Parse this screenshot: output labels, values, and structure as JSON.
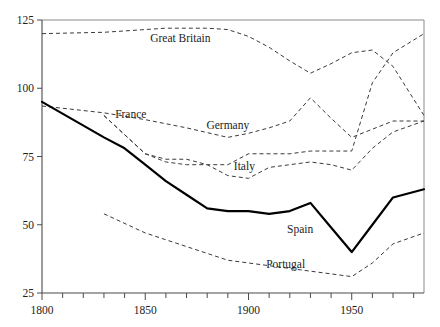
{
  "chart_data": {
    "type": "line",
    "title": "",
    "subtitle": "",
    "xlabel": "",
    "ylabel": "",
    "xlim": [
      1800,
      1985
    ],
    "ylim": [
      25,
      125
    ],
    "grid": false,
    "legend_position": "inline-annotations",
    "x_ticks_major": [
      1800,
      1850,
      1900,
      1950
    ],
    "x_tick_labels": [
      "1800",
      "1850",
      "1900",
      "1950"
    ],
    "x_ticks_minor_step": 10,
    "y_ticks": [
      25,
      50,
      75,
      100,
      125
    ],
    "y_tick_labels": [
      "25",
      "50",
      "75",
      "100",
      "125"
    ],
    "series": [
      {
        "name": "Great Britain",
        "style": "dashed",
        "color": "#3a3a3a",
        "label_x": 1867,
        "label_y": 117,
        "x": [
          1800,
          1830,
          1850,
          1860,
          1880,
          1890,
          1900,
          1910,
          1920,
          1930,
          1940,
          1950,
          1960,
          1970,
          1985
        ],
        "values": [
          120,
          120.5,
          121.5,
          122,
          122,
          121.5,
          119,
          115,
          110,
          105.5,
          109,
          113,
          114,
          108,
          90
        ]
      },
      {
        "name": "France",
        "style": "dashed",
        "color": "#3a3a3a",
        "label_x": 1843,
        "label_y": 89,
        "x": [
          1800,
          1830,
          1850,
          1870,
          1890,
          1900,
          1910,
          1920,
          1930,
          1940,
          1950,
          1960,
          1970,
          1985
        ],
        "values": [
          93.5,
          91,
          88.5,
          85.5,
          82,
          83.5,
          85.5,
          88,
          96.5,
          89,
          82,
          85,
          88,
          88
        ]
      },
      {
        "name": "Germany",
        "style": "dashed",
        "color": "#3a3a3a",
        "label_x": 1890,
        "label_y": 85,
        "x": [
          1830,
          1850,
          1860,
          1870,
          1880,
          1890,
          1900,
          1910,
          1920,
          1930,
          1940,
          1950,
          1960,
          1970,
          1985
        ],
        "values": [
          90,
          76,
          73,
          72,
          72,
          72,
          76,
          76,
          76,
          77,
          77,
          77,
          102,
          113,
          120
        ]
      },
      {
        "name": "Italy",
        "style": "dashed",
        "color": "#3a3a3a",
        "label_x": 1898,
        "label_y": 70,
        "x": [
          1830,
          1850,
          1860,
          1870,
          1880,
          1890,
          1900,
          1910,
          1920,
          1930,
          1940,
          1950,
          1960,
          1970,
          1985
        ],
        "values": [
          90,
          76,
          74,
          74,
          72,
          68,
          67,
          71,
          72,
          73,
          72,
          70,
          78,
          84,
          88
        ]
      },
      {
        "name": "Spain",
        "style": "solid",
        "color": "#000000",
        "label_x": 1925,
        "label_y": 47,
        "x": [
          1800,
          1830,
          1840,
          1850,
          1860,
          1870,
          1880,
          1890,
          1900,
          1910,
          1920,
          1930,
          1940,
          1950,
          1960,
          1970,
          1985
        ],
        "values": [
          95,
          82,
          78,
          72,
          66,
          61,
          56,
          55,
          55,
          54,
          55,
          58,
          49,
          40,
          50,
          60,
          63
        ]
      },
      {
        "name": "Portugal",
        "style": "dashed",
        "color": "#3a3a3a",
        "label_x": 1918,
        "label_y": 34,
        "x": [
          1830,
          1850,
          1870,
          1890,
          1900,
          1910,
          1920,
          1930,
          1940,
          1950,
          1960,
          1970,
          1985
        ],
        "values": [
          54,
          47,
          42,
          37,
          36,
          35,
          34,
          33,
          32,
          31,
          36,
          43,
          47
        ]
      }
    ]
  }
}
